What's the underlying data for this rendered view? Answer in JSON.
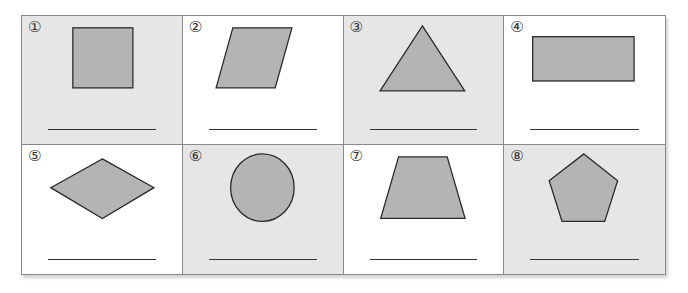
{
  "worksheet": {
    "cells": [
      {
        "number": "①",
        "shape": "square",
        "answer": ""
      },
      {
        "number": "②",
        "shape": "parallelogram",
        "answer": ""
      },
      {
        "number": "③",
        "shape": "triangle",
        "answer": ""
      },
      {
        "number": "④",
        "shape": "rectangle",
        "answer": ""
      },
      {
        "number": "⑤",
        "shape": "rhombus",
        "answer": ""
      },
      {
        "number": "⑥",
        "shape": "circle",
        "answer": ""
      },
      {
        "number": "⑦",
        "shape": "trapezoid",
        "answer": ""
      },
      {
        "number": "⑧",
        "shape": "pentagon",
        "answer": ""
      }
    ],
    "colors": {
      "shape_fill": "#b4b4b4",
      "shape_stroke": "#2a2a2a",
      "gray_cell": "#e6e6e6",
      "white_cell": "#ffffff",
      "border": "#8a8a8a"
    }
  }
}
